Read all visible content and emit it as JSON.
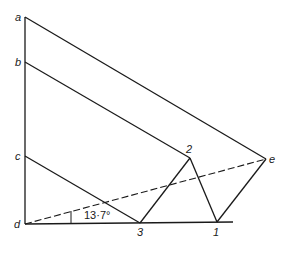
{
  "diagram": {
    "title": "",
    "points": {
      "a": {
        "label": "a",
        "x": 25,
        "y": 17
      },
      "b": {
        "label": "b",
        "x": 25,
        "y": 62
      },
      "c": {
        "label": "c",
        "x": 25,
        "y": 156
      },
      "d": {
        "label": "d",
        "x": 25,
        "y": 224
      },
      "e": {
        "label": "e",
        "x": 266,
        "y": 159
      },
      "p1": {
        "label": "1",
        "x": 217,
        "y": 222
      },
      "p2": {
        "label": "2",
        "x": 190,
        "y": 158
      },
      "p3": {
        "label": "3",
        "x": 140,
        "y": 223
      }
    },
    "angle_label": "13·7°",
    "edges": [
      [
        "a",
        "d"
      ],
      [
        "a",
        "e"
      ],
      [
        "b",
        "p2"
      ],
      [
        "c",
        "p3"
      ],
      [
        "p3",
        "p2"
      ],
      [
        "p2",
        "p1"
      ],
      [
        "p1",
        "e"
      ],
      [
        "d",
        "baseline_end"
      ]
    ],
    "dashed_edges": [
      [
        "d",
        "e"
      ]
    ]
  }
}
